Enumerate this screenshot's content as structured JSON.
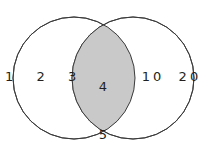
{
  "diagram": {
    "type": "venn",
    "title": "",
    "background_color": "#ffffff",
    "stroke_color": "#3b3b3b",
    "shaded_region_color": "#c9c9c9",
    "text_color": "#231f20",
    "left_circle": {
      "name": "left-set-circle",
      "cx": 74,
      "cy": 78,
      "r": 61,
      "fill": "#ffffff"
    },
    "right_circle": {
      "name": "right-set-circle",
      "cx": 133,
      "cy": 78,
      "r": 61,
      "fill": "#ffffff"
    },
    "regions": {
      "left_only": {
        "label": "1  2  3",
        "elements": [
          "1",
          "2",
          "3"
        ],
        "shaded": false
      },
      "right_only": {
        "label": "10  20",
        "elements": [
          "10",
          "20"
        ],
        "shaded": false
      },
      "intersection": {
        "elements": [
          "4",
          "5",
          "6"
        ],
        "shaded": true,
        "fill": "#c9c9c9"
      }
    }
  }
}
